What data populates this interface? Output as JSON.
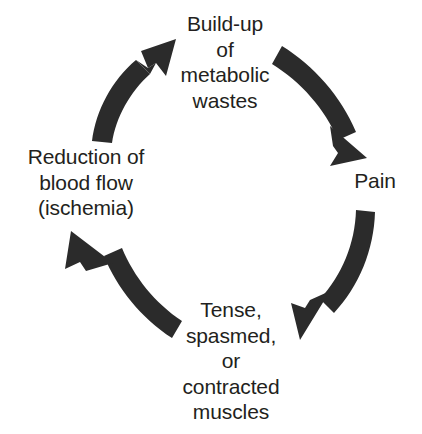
{
  "diagram": {
    "type": "cycle",
    "background_color": "#ffffff",
    "text_color": "#231f20",
    "arrow_color": "#2b2b2b",
    "direction": "clockwise",
    "nodes": [
      {
        "id": "buildup",
        "label": "Build-up\nof\nmetabolic\nwastes",
        "position": "top"
      },
      {
        "id": "pain",
        "label": "Pain",
        "position": "right"
      },
      {
        "id": "muscles",
        "label": "Tense,\nspasmed,\nor\ncontracted\nmuscles",
        "position": "bottom"
      },
      {
        "id": "ischemia",
        "label": "Reduction of\nblood flow\n(ischemia)",
        "position": "left"
      }
    ],
    "arrows": [
      {
        "id": "arrow-buildup-to-pain",
        "from": "buildup",
        "to": "pain",
        "quadrant": "top-right"
      },
      {
        "id": "arrow-pain-to-muscles",
        "from": "pain",
        "to": "muscles",
        "quadrant": "bottom-right"
      },
      {
        "id": "arrow-muscles-to-ischemia",
        "from": "muscles",
        "to": "ischemia",
        "quadrant": "bottom-left"
      },
      {
        "id": "arrow-ischemia-to-buildup",
        "from": "ischemia",
        "to": "buildup",
        "quadrant": "top-left"
      }
    ]
  }
}
